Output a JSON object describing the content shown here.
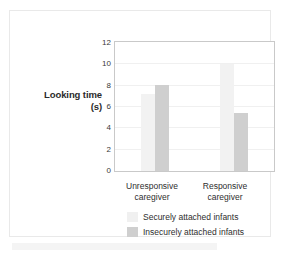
{
  "chart_data": {
    "type": "bar",
    "title": "",
    "xlabel": "",
    "ylabel": "Looking time\n(s)",
    "ylabel_line1": "Looking time",
    "ylabel_line2": "(s)",
    "categories": [
      "Unresponsive caregiver",
      "Responsive caregiver"
    ],
    "category_lines": [
      {
        "line1": "Unresponsive",
        "line2": "caregiver"
      },
      {
        "line1": "Responsive",
        "line2": "caregiver"
      }
    ],
    "series": [
      {
        "name": "Securely attached infants",
        "color": "#f2f2f2",
        "values": [
          7.2,
          10.0
        ]
      },
      {
        "name": "Insecurely attached infants",
        "color": "#cfcfcf",
        "values": [
          8.0,
          5.4
        ]
      }
    ],
    "ylim": [
      0,
      12
    ],
    "yticks": [
      12,
      10,
      8,
      6,
      4,
      2,
      0
    ],
    "ytick_labels": [
      "12",
      "10",
      "8",
      "6",
      "4",
      "2",
      "0"
    ],
    "grid": true,
    "grid_color": "#f0f0f0",
    "legend_position": "bottom-center",
    "legend": [
      "Securely attached infants",
      "Insecurely attached infants"
    ],
    "axis_border_color": "#c9c9c9",
    "plot_background": "#ffffff"
  }
}
